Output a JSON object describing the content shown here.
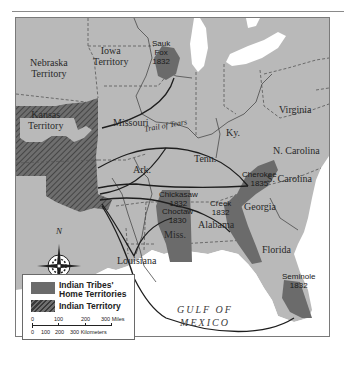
{
  "map": {
    "title": "Trail of Tears",
    "colors": {
      "land": "#b9b9b9",
      "water": "#ffffff",
      "tribal_territory": "#6b6b6b",
      "indian_territory_hatch": "#4a4a4a",
      "route": "#1e1e1e",
      "border": "#555555"
    },
    "regions": {
      "nebraska": [
        "Nebraska",
        "Territory"
      ],
      "iowa": [
        "Iowa",
        "Territory"
      ],
      "kansas": [
        "Kansas",
        "Territory"
      ],
      "missouri": "Missouri",
      "virginia": "Virginia",
      "kentucky": "Ky.",
      "tennessee": "Tenn.",
      "arkansas": "Ark.",
      "n_carolina": "N. Carolina",
      "s_carolina": "S. Carolina",
      "georgia": "Georgia",
      "alabama": "Alabama",
      "mississippi": "Miss.",
      "louisiana": "Louisiana",
      "florida": "Florida"
    },
    "route_label": "Trail of Tears",
    "water_label": [
      "GULF OF",
      "MEXICO"
    ],
    "tribes": [
      {
        "name": "Sauk",
        "name2": "Fox",
        "year": "1832"
      },
      {
        "name": "Cherokee",
        "year": "1835"
      },
      {
        "name": "Chickasaw",
        "year": "1832"
      },
      {
        "name": "Choctaw",
        "year": "1830"
      },
      {
        "name": "Creek",
        "year": "1832"
      },
      {
        "name": "Seminole",
        "year": "1832"
      }
    ],
    "compass": {
      "north_label": "N"
    }
  },
  "legend": {
    "items": [
      {
        "label_line1": "Indian Tribes'",
        "label_line2": "Home Territories"
      },
      {
        "label_line1": "Indian Territory"
      }
    ],
    "scale_miles": [
      "0",
      "100",
      "200",
      "300 Miles"
    ],
    "scale_km": [
      "0",
      "100",
      "200",
      "300 Kilometers"
    ]
  }
}
